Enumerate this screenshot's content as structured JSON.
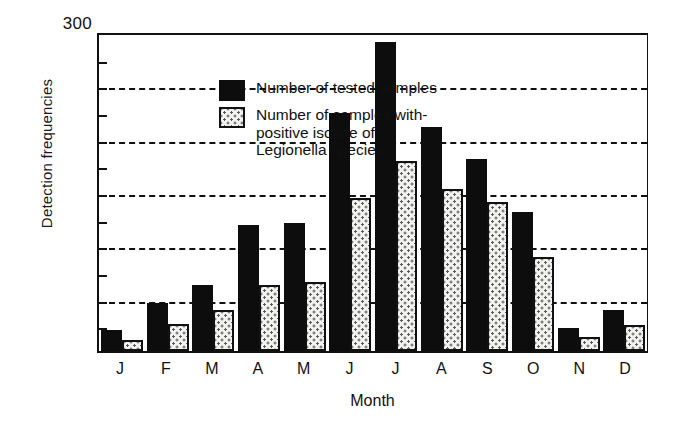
{
  "chart_data": {
    "type": "bar",
    "title": "",
    "xlabel": "Month",
    "ylabel": "Detection frequencies",
    "categories": [
      "J",
      "F",
      "M",
      "A",
      "M",
      "J",
      "J",
      "A",
      "S",
      "O",
      "N",
      "D"
    ],
    "series": [
      {
        "name": "Number of tested samples",
        "values": [
          20,
          45,
          62,
          118,
          120,
          223,
          290,
          210,
          180,
          130,
          22,
          38
        ],
        "color": "#0d0d0d",
        "fill": "solid-black"
      },
      {
        "name": "Number of samples with positive isolate of Legionella species",
        "values": [
          10,
          25,
          38,
          62,
          65,
          143,
          178,
          152,
          140,
          88,
          13,
          24
        ],
        "color": "#f2f2f0",
        "fill": "stippled-white"
      }
    ],
    "ylim": [
      0,
      300
    ],
    "y_axis_top_label": "300",
    "gridlines": [
      250,
      200,
      150,
      100,
      50
    ],
    "ticks": [
      300,
      275,
      250,
      225,
      200,
      175,
      150,
      125,
      100,
      75,
      50,
      25
    ],
    "grid": true,
    "legend_position": "top-left"
  },
  "legend": {
    "items": [
      {
        "label": "Number of tested samples",
        "swatch": "solid-black"
      },
      {
        "label": "Number of samples with\npositive isolate of\nLegionella species",
        "swatch": "stippled-white"
      }
    ],
    "item1_line1": "Number of tested samples",
    "item2_line1": "Number of samples with-",
    "item2_line2": "positive isolate of",
    "item2_line3": "Legionella species"
  },
  "axes": {
    "y_title": "Detection frequencies",
    "y_max_label": "300",
    "x_title": "Month"
  }
}
